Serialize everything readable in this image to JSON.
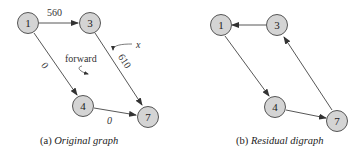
{
  "left": {
    "caption_prefix": "(a) ",
    "caption_title": "Original graph",
    "nodes": {
      "n1": "1",
      "n3": "3",
      "n4": "4",
      "n7": "7"
    },
    "edge_labels": {
      "e13": "560",
      "e14": "0",
      "e37": "610",
      "e47": "0"
    },
    "annotations": {
      "forward": "forward",
      "x": "x"
    }
  },
  "right": {
    "caption_prefix": "(b) ",
    "caption_title": "Residual digraph",
    "nodes": {
      "n1": "1",
      "n3": "3",
      "n4": "4",
      "n7": "7"
    }
  },
  "colors": {
    "node_fill": "#d4d4d4",
    "node_stroke": "#555555",
    "edge": "#444444"
  }
}
